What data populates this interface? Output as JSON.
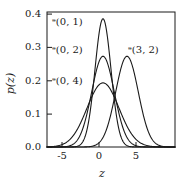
{
  "chart_data": {
    "type": "line",
    "title": "",
    "xlabel": "z",
    "ylabel": "p(z)",
    "xlim": [
      -7.0,
      9.0
    ],
    "ylim": [
      0.0,
      0.42
    ],
    "grid": false,
    "legend_position": "inline-annotations",
    "xticks": [
      "-5",
      "0",
      "5"
    ],
    "xtick_values": [
      -5,
      0,
      5
    ],
    "yticks": [
      "0.0",
      "0.1",
      "0.2",
      "0.3",
      "0.4"
    ],
    "ytick_values": [
      0.0,
      0.1,
      0.2,
      0.3,
      0.4
    ],
    "line_color": "#1a1a1a",
    "series": [
      {
        "name": "N(0, 1)",
        "label": "ᵊ(0, 1)",
        "mean": 0,
        "variance": 1,
        "sigma": 1.0,
        "peak_value": 0.399,
        "peak_x": 0
      },
      {
        "name": "N(0, 2)",
        "label": "ᵊ(0, 2)",
        "mean": 0,
        "variance": 2,
        "sigma": 1.4142,
        "peak_value": 0.282,
        "peak_x": 0
      },
      {
        "name": "N(0, 4)",
        "label": "ᵊ(0, 4)",
        "mean": 0,
        "variance": 4,
        "sigma": 2.0,
        "peak_value": 0.199,
        "peak_x": 0
      },
      {
        "name": "N(3, 2)",
        "label": "ᵊ(3, 2)",
        "mean": 3,
        "variance": 2,
        "sigma": 1.4142,
        "peak_value": 0.282,
        "peak_x": 3
      }
    ],
    "annotations": [
      {
        "text": "ᵊ(0, 1)",
        "for_series": "N(0, 1)",
        "x_px": 52,
        "y_px": 17
      },
      {
        "text": "ᵊ(0, 2)",
        "for_series": "N(0, 2)",
        "x_px": 52,
        "y_px": 45
      },
      {
        "text": "ᵊ(0, 4)",
        "for_series": "N(0, 4)",
        "x_px": 52,
        "y_px": 76
      },
      {
        "text": "ᵊ(3, 2)",
        "for_series": "N(3, 2)",
        "x_px": 128,
        "y_px": 45
      }
    ]
  },
  "axes": {
    "ytick_labels": [
      "0.4",
      "0.3",
      "0.2",
      "0.1",
      "0.0"
    ],
    "xtick_labels": [
      "-5",
      "0",
      "5"
    ],
    "y_axis_title": "p(z)",
    "x_axis_title": "z"
  }
}
